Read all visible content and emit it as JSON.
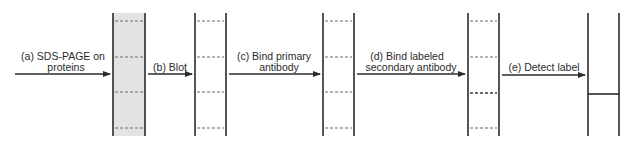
{
  "diagram": {
    "steps": [
      {
        "id": "a",
        "line1": "(a) SDS-PAGE on",
        "line2": "proteins"
      },
      {
        "id": "b",
        "line1": "(b) Blot",
        "line2": ""
      },
      {
        "id": "c",
        "line1": "(c) Bind primary",
        "line2": "antibody"
      },
      {
        "id": "d",
        "line1": "(d) Bind labeled",
        "line2": "secondary antibody"
      },
      {
        "id": "e",
        "line1": "(e) Detect label",
        "line2": ""
      }
    ],
    "lanes": [
      {
        "name": "gel",
        "x1": 113,
        "x2": 145,
        "fill": "#e3e3e3",
        "bands": [
          21,
          57,
          92,
          128
        ],
        "band_style": "dashed"
      },
      {
        "name": "blot",
        "x1": 195,
        "x2": 226,
        "fill": "#ffffff",
        "bands": [
          21,
          57,
          92,
          128
        ],
        "band_style": "dashed"
      },
      {
        "name": "primary-bound",
        "x1": 323,
        "x2": 354,
        "fill": "#ffffff",
        "bands": [
          21,
          57,
          92,
          128
        ],
        "band_style": "dashed"
      },
      {
        "name": "secondary-bound",
        "x1": 468,
        "x2": 499,
        "fill": "#ffffff",
        "bands": [
          21,
          57,
          92,
          128
        ],
        "band_style": "dashed",
        "highlight_band": 92
      },
      {
        "name": "detected",
        "x1": 588,
        "x2": 619,
        "fill": "#ffffff",
        "bands": [
          94
        ],
        "band_style": "solid"
      }
    ],
    "colors": {
      "line": "#2b2b2b",
      "dash": "#6a6a6a",
      "gel_fill": "#e3e3e3"
    }
  }
}
